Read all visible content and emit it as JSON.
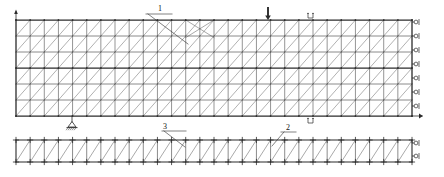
{
  "diagram": {
    "type": "engineering-line-drawing",
    "background_color": "#ffffff",
    "line_color": "#2b2b2b",
    "brace_color": "#6f6f6f",
    "canvas": {
      "width": 444,
      "height": 177
    }
  },
  "labels": {
    "callout_1": "1",
    "callout_2": "2",
    "callout_3": "3"
  },
  "main_panel": {
    "name": "upper-braced-panel",
    "x": 16,
    "y": 20,
    "width": 396,
    "height": 96,
    "columns": 28,
    "rows": 6,
    "brace_direction": "diagonal-up-right",
    "row_line_weights": [
      "heavy",
      "light",
      "light",
      "heavy",
      "light",
      "light"
    ]
  },
  "lower_truss": {
    "name": "lower-truss",
    "x": 16,
    "y": 140,
    "width": 396,
    "height": 22,
    "panels": 28,
    "node_marker": "plus-cross",
    "brace_direction": "diagonal-up-right"
  },
  "supports": {
    "right_rollers_upper": {
      "name": "roller-support",
      "count": 7,
      "x": 412,
      "y_positions": [
        22,
        36,
        50,
        64,
        78,
        92,
        106
      ],
      "symbol": "roller"
    },
    "right_rollers_lower": {
      "name": "roller-support",
      "count": 2,
      "x": 412,
      "y_positions": [
        143,
        156
      ],
      "symbol": "roller"
    },
    "pin_support": {
      "name": "pin-support",
      "x": 72,
      "y": 116,
      "symbol": "triangle-hatched"
    },
    "left_edge_marker": {
      "name": "axis-tick-top-left",
      "x": 16,
      "y": 12,
      "symbol": "up-arrow"
    }
  },
  "loads": {
    "point_load": {
      "name": "point-load-arrow",
      "x": 268,
      "y_top": 8,
      "y_tip": 20,
      "direction": "down"
    }
  },
  "section_marks": {
    "top_mark": {
      "name": "section-mark-top",
      "x": 312,
      "y": 13
    },
    "bottom_mark": {
      "name": "section-mark-bottom",
      "x": 312,
      "y": 118
    }
  },
  "leaders": {
    "leader_1": {
      "from_x": 148,
      "from_y": 14,
      "to_x": 188,
      "to_y": 44
    },
    "leader_2": {
      "from_x": 284,
      "from_y": 132,
      "to_x": 272,
      "to_y": 146
    },
    "leader_3": {
      "from_x": 164,
      "from_y": 131,
      "to_x": 185,
      "to_y": 147
    }
  }
}
